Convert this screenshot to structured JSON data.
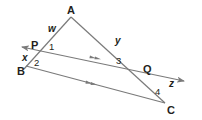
{
  "diagram": {
    "type": "geometry",
    "colors": {
      "stroke": "#7a7a7a",
      "text": "#231f20",
      "background": "#ffffff"
    },
    "points": {
      "A": {
        "label": "A",
        "x": 71,
        "y": 17
      },
      "P": {
        "label": "P",
        "x": 36,
        "y": 50
      },
      "B": {
        "label": "B",
        "x": 26,
        "y": 66
      },
      "Q": {
        "label": "Q",
        "x": 138,
        "y": 77
      },
      "C": {
        "label": "C",
        "x": 165,
        "y": 103
      }
    },
    "segment_labels": {
      "w": "w",
      "y": "y",
      "x": "x",
      "z": "z"
    },
    "angle_labels": {
      "a1": "1",
      "a2": "2",
      "a3": "3",
      "a4": "4"
    },
    "lines": [
      {
        "name": "AB",
        "from": "A",
        "to": "B"
      },
      {
        "name": "AC",
        "from": "A",
        "to": "C"
      },
      {
        "name": "PQ",
        "from": "P",
        "to": "Q",
        "arrows": "both ends",
        "parallel_marks": 2
      },
      {
        "name": "BC",
        "from": "B",
        "to": "C",
        "parallel_marks": 2
      }
    ]
  }
}
